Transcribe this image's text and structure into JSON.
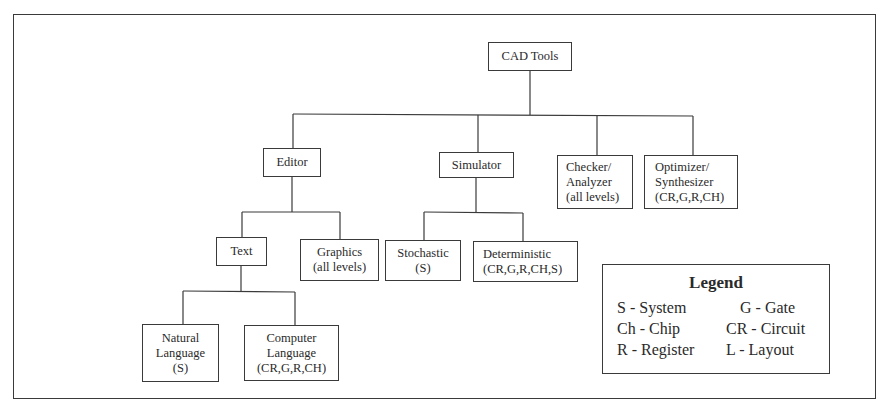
{
  "diagram": {
    "root": {
      "label": [
        "CAD Tools"
      ]
    },
    "level1": [
      {
        "id": "editor",
        "label": [
          "Editor"
        ]
      },
      {
        "id": "simulator",
        "label": [
          "Simulator"
        ]
      },
      {
        "id": "checker",
        "label": [
          "Checker/",
          "Analyzer",
          "(all levels)"
        ]
      },
      {
        "id": "optimizer",
        "label": [
          "Optimizer/",
          "Synthesizer",
          "(CR,G,R,CH)"
        ]
      }
    ],
    "editor_children": [
      {
        "id": "text",
        "label": [
          "Text"
        ]
      },
      {
        "id": "graphics",
        "label": [
          "Graphics",
          "(all levels)"
        ]
      }
    ],
    "simulator_children": [
      {
        "id": "stochastic",
        "label": [
          "Stochastic",
          "(S)"
        ]
      },
      {
        "id": "deterministic",
        "label": [
          "Deterministic",
          "(CR,G,R,CH,S)"
        ]
      }
    ],
    "text_children": [
      {
        "id": "natural-language",
        "label": [
          "Natural",
          "Language",
          "(S)"
        ]
      },
      {
        "id": "computer-language",
        "label": [
          "Computer",
          "Language",
          "(CR,G,R,CH)"
        ]
      }
    ],
    "edges": [
      [
        "CAD Tools",
        "Editor"
      ],
      [
        "CAD Tools",
        "Simulator"
      ],
      [
        "CAD Tools",
        "Checker/Analyzer"
      ],
      [
        "CAD Tools",
        "Optimizer/Synthesizer"
      ],
      [
        "Editor",
        "Text"
      ],
      [
        "Editor",
        "Graphics"
      ],
      [
        "Simulator",
        "Stochastic"
      ],
      [
        "Simulator",
        "Deterministic"
      ],
      [
        "Text",
        "Natural Language"
      ],
      [
        "Text",
        "Computer Language"
      ]
    ]
  },
  "legend": {
    "title": "Legend",
    "items": [
      {
        "text": "S - System"
      },
      {
        "text": "G - Gate"
      },
      {
        "text": "Ch - Chip"
      },
      {
        "text": "CR - Circuit"
      },
      {
        "text": "R - Register"
      },
      {
        "text": "L - Layout"
      }
    ]
  },
  "colors": {
    "line": "#3a3a3a",
    "text": "#2a2a2a",
    "background": "#ffffff"
  }
}
